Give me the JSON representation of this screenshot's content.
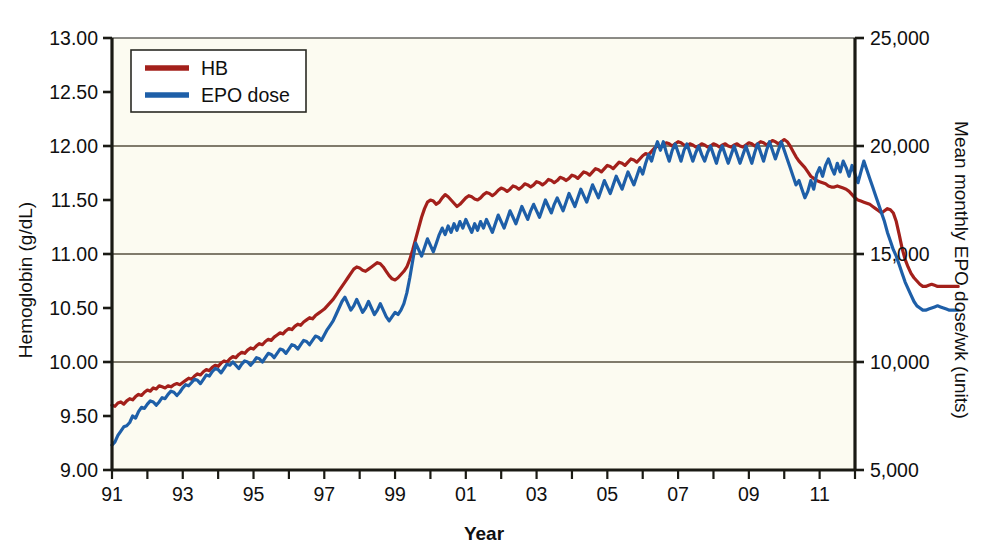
{
  "chart_data": {
    "type": "line",
    "title": "",
    "xlabel": "Year",
    "ylabel": "Hemoglobin (g/dL)",
    "y2label": "Mean monthly EPO dose/wk (units)",
    "xlim": [
      1991.0,
      2012.0
    ],
    "ylim": [
      9.0,
      13.0
    ],
    "y2lim": [
      5000,
      25000
    ],
    "grid": "horizontal gridlines at 10.00, 11.00, 12.00",
    "legend_position": "top-left inside plot",
    "x_tick_labels": [
      "91",
      "93",
      "95",
      "97",
      "99",
      "01",
      "03",
      "05",
      "07",
      "09",
      "11"
    ],
    "x_tick_values": [
      1991,
      1993,
      1995,
      1997,
      1999,
      2001,
      2003,
      2005,
      2007,
      2009,
      2011
    ],
    "x_minor_tick_values": [
      1992,
      1994,
      1996,
      1998,
      2000,
      2002,
      2004,
      2006,
      2008,
      2010,
      2012
    ],
    "y_tick_labels": [
      "9.00",
      "9.50",
      "10.00",
      "10.50",
      "11.00",
      "11.50",
      "12.00",
      "12.50",
      "13.00"
    ],
    "y_tick_values": [
      9.0,
      9.5,
      10.0,
      10.5,
      11.0,
      11.5,
      12.0,
      12.5,
      13.0
    ],
    "y_gridline_values": [
      10.0,
      11.0,
      12.0
    ],
    "y2_tick_labels": [
      "5,000",
      "10,000",
      "15,000",
      "20,000",
      "25,000"
    ],
    "y2_tick_values": [
      5000,
      10000,
      15000,
      20000,
      25000
    ],
    "colors": {
      "hb": "#A3201B",
      "epo": "#1E5FA8",
      "plot_background": "#FCFBF1",
      "axis": "#1A1A14",
      "gridline": "#57513F"
    },
    "series": [
      {
        "name": "HB",
        "axis": "left",
        "units": "g/dL",
        "color": "#A3201B",
        "x_start": 1991.0,
        "x_step": 0.0833333,
        "values": [
          9.6,
          9.59,
          9.62,
          9.63,
          9.61,
          9.64,
          9.66,
          9.65,
          9.68,
          9.7,
          9.69,
          9.72,
          9.74,
          9.73,
          9.76,
          9.75,
          9.78,
          9.77,
          9.76,
          9.78,
          9.77,
          9.79,
          9.8,
          9.79,
          9.81,
          9.83,
          9.85,
          9.84,
          9.87,
          9.89,
          9.88,
          9.91,
          9.93,
          9.92,
          9.95,
          9.97,
          9.96,
          9.99,
          10.01,
          10.0,
          10.03,
          10.05,
          10.04,
          10.07,
          10.09,
          10.08,
          10.11,
          10.13,
          10.12,
          10.15,
          10.17,
          10.16,
          10.19,
          10.21,
          10.2,
          10.23,
          10.25,
          10.27,
          10.26,
          10.29,
          10.31,
          10.3,
          10.33,
          10.35,
          10.34,
          10.37,
          10.39,
          10.41,
          10.4,
          10.43,
          10.45,
          10.47,
          10.49,
          10.52,
          10.55,
          10.58,
          10.62,
          10.66,
          10.7,
          10.74,
          10.78,
          10.82,
          10.86,
          10.88,
          10.87,
          10.85,
          10.84,
          10.86,
          10.88,
          10.9,
          10.92,
          10.91,
          10.88,
          10.84,
          10.8,
          10.77,
          10.76,
          10.78,
          10.81,
          10.84,
          10.88,
          10.95,
          11.04,
          11.14,
          11.24,
          11.34,
          11.42,
          11.48,
          11.5,
          11.49,
          11.46,
          11.48,
          11.52,
          11.55,
          11.53,
          11.5,
          11.47,
          11.44,
          11.46,
          11.49,
          11.52,
          11.54,
          11.53,
          11.51,
          11.5,
          11.52,
          11.55,
          11.57,
          11.56,
          11.54,
          11.56,
          11.59,
          11.61,
          11.6,
          11.58,
          11.6,
          11.63,
          11.62,
          11.6,
          11.62,
          11.65,
          11.64,
          11.62,
          11.64,
          11.67,
          11.66,
          11.64,
          11.66,
          11.69,
          11.68,
          11.66,
          11.68,
          11.71,
          11.7,
          11.68,
          11.7,
          11.73,
          11.72,
          11.7,
          11.73,
          11.76,
          11.75,
          11.73,
          11.76,
          11.79,
          11.78,
          11.76,
          11.79,
          11.82,
          11.81,
          11.79,
          11.82,
          11.85,
          11.84,
          11.82,
          11.85,
          11.88,
          11.87,
          11.85,
          11.88,
          11.91,
          11.93,
          11.92,
          11.95,
          11.98,
          12.0,
          11.99,
          12.01,
          12.03,
          12.02,
          12.0,
          12.02,
          12.04,
          12.03,
          12.01,
          12.0,
          12.02,
          12.01,
          11.99,
          12.0,
          12.02,
          12.01,
          11.99,
          12.0,
          12.02,
          12.01,
          11.99,
          12.01,
          12.02,
          12.0,
          11.99,
          12.01,
          12.02,
          12.0,
          11.99,
          12.01,
          12.03,
          12.02,
          12.0,
          12.02,
          12.04,
          12.03,
          12.01,
          12.03,
          12.05,
          12.04,
          12.02,
          12.04,
          12.06,
          12.04,
          12.0,
          11.95,
          11.9,
          11.86,
          11.83,
          11.8,
          11.76,
          11.72,
          11.7,
          11.68,
          11.67,
          11.66,
          11.65,
          11.63,
          11.62,
          11.62,
          11.63,
          11.62,
          11.61,
          11.6,
          11.58,
          11.55,
          11.52,
          11.5,
          11.49,
          11.48,
          11.47,
          11.46,
          11.44,
          11.42,
          11.4,
          11.38,
          11.4,
          11.42,
          11.41,
          11.38,
          11.3,
          11.18,
          11.05,
          10.95,
          10.88,
          10.82,
          10.78,
          10.75,
          10.72,
          10.7,
          10.7,
          10.71,
          10.72,
          10.71,
          10.7,
          10.7,
          10.7,
          10.7,
          10.7,
          10.7,
          10.7,
          10.7
        ]
      },
      {
        "name": "EPO dose",
        "axis": "right",
        "units": "units/wk",
        "color": "#1E5FA8",
        "x_start": 1991.0,
        "x_step": 0.0833333,
        "values": [
          6150,
          6300,
          6600,
          6800,
          7000,
          7050,
          7200,
          7500,
          7400,
          7700,
          7900,
          7850,
          8050,
          8200,
          8150,
          8000,
          8150,
          8350,
          8300,
          8500,
          8650,
          8600,
          8450,
          8600,
          8800,
          8950,
          8900,
          9050,
          9200,
          9150,
          9000,
          9200,
          9400,
          9350,
          9550,
          9700,
          9650,
          9500,
          9700,
          9900,
          9850,
          10000,
          9850,
          9700,
          9900,
          10050,
          10000,
          9850,
          10000,
          10200,
          10150,
          10000,
          10200,
          10400,
          10350,
          10200,
          10400,
          10600,
          10550,
          10400,
          10600,
          10800,
          10750,
          10600,
          10800,
          11000,
          10950,
          10800,
          11000,
          11200,
          11150,
          11000,
          11250,
          11500,
          11700,
          11900,
          12200,
          12500,
          12800,
          13000,
          12700,
          12400,
          12600,
          12900,
          12600,
          12300,
          12500,
          12800,
          12500,
          12200,
          12400,
          12700,
          12400,
          12100,
          11900,
          12100,
          12300,
          12200,
          12400,
          12700,
          13200,
          13900,
          14700,
          15500,
          15200,
          14900,
          15300,
          15700,
          15400,
          15100,
          15500,
          15900,
          16200,
          15900,
          16300,
          16000,
          16400,
          16100,
          16500,
          16200,
          16600,
          16300,
          16000,
          16400,
          16100,
          16500,
          16200,
          16600,
          16300,
          16000,
          16400,
          16800,
          16500,
          16200,
          16600,
          17000,
          16700,
          16400,
          16800,
          17200,
          16900,
          16600,
          17000,
          17300,
          17000,
          16700,
          17100,
          17500,
          17200,
          16900,
          17300,
          17600,
          17300,
          17000,
          17400,
          17800,
          17500,
          17200,
          17600,
          18000,
          17700,
          17400,
          17800,
          18200,
          17900,
          17600,
          18000,
          18400,
          18100,
          17800,
          18200,
          18600,
          18300,
          18000,
          18400,
          18800,
          18500,
          18200,
          18600,
          19000,
          18700,
          19200,
          19600,
          19300,
          19800,
          20200,
          19800,
          20200,
          19700,
          19300,
          19800,
          20100,
          19700,
          19300,
          19800,
          20100,
          19700,
          19300,
          19700,
          20000,
          19600,
          19300,
          19700,
          20000,
          19600,
          19200,
          19700,
          20000,
          19600,
          19200,
          19600,
          20000,
          19600,
          19200,
          19600,
          20000,
          19600,
          19200,
          19700,
          20100,
          19700,
          19300,
          19800,
          20200,
          19800,
          19400,
          19800,
          20200,
          19800,
          19400,
          19000,
          18600,
          18200,
          18400,
          18000,
          17600,
          17900,
          18400,
          18000,
          18700,
          19000,
          18600,
          19100,
          19400,
          19000,
          18700,
          19200,
          18800,
          19300,
          19000,
          18600,
          19100,
          18700,
          18300,
          18800,
          19300,
          18900,
          18500,
          18100,
          17700,
          17300,
          16900,
          16500,
          16000,
          15600,
          15200,
          14900,
          14500,
          14100,
          13700,
          13400,
          13100,
          12800,
          12600,
          12500,
          12400,
          12400,
          12450,
          12500,
          12550,
          12600,
          12550,
          12500,
          12450,
          12400,
          12400,
          12400,
          12400
        ]
      }
    ]
  },
  "legend": {
    "items": [
      {
        "label": "HB",
        "color": "#A3201B"
      },
      {
        "label": "EPO dose",
        "color": "#1E5FA8"
      }
    ]
  }
}
